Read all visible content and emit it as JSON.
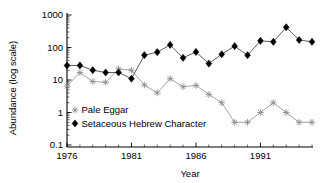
{
  "chart_data": {
    "type": "line",
    "title": "",
    "xlabel": "Year",
    "ylabel": "Abundance (log scale)",
    "yscale": "log",
    "ylim": [
      0.1,
      1000
    ],
    "xlim": [
      1976,
      1995
    ],
    "grid": false,
    "legend_position": "lower-left-inside",
    "ytick_labels": [
      "1000",
      "100",
      "10",
      "1",
      "0.1"
    ],
    "ytick_values": [
      1000,
      100,
      10,
      1,
      0.1
    ],
    "xtick_labels": [
      "1976",
      "1981",
      "1986",
      "1991"
    ],
    "xtick_values": [
      1976,
      1981,
      1986,
      1991
    ],
    "x": [
      1976,
      1977,
      1978,
      1979,
      1980,
      1981,
      1982,
      1983,
      1984,
      1985,
      1986,
      1987,
      1988,
      1989,
      1990,
      1991,
      1992,
      1993,
      1994,
      1995
    ],
    "series": [
      {
        "name": "Pale Eggar",
        "marker": "star",
        "color": "#8c8c8c",
        "values": [
          6.5,
          17,
          9,
          8.5,
          22,
          20,
          7,
          4,
          11,
          6.2,
          6.8,
          3.6,
          2.0,
          0.5,
          0.5,
          1.0,
          2.0,
          1.0,
          0.5,
          0.5
        ]
      },
      {
        "name": "Setaceous Hebrew Character",
        "marker": "diamond",
        "color": "#000000",
        "values": [
          28,
          28,
          20,
          17,
          17,
          11,
          58,
          72,
          120,
          48,
          73,
          32,
          62,
          110,
          58,
          160,
          150,
          420,
          170,
          150
        ]
      }
    ]
  },
  "legend": {
    "entries": [
      {
        "label": "Pale Eggar",
        "marker": "star"
      },
      {
        "label": "Setaceous Hebrew Character",
        "marker": "diamond"
      }
    ]
  }
}
